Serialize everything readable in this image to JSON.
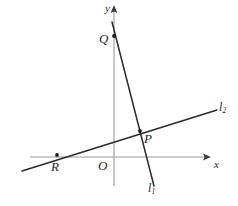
{
  "figure": {
    "background_color": "#ffffff",
    "axis_color": "#9a9a9a",
    "line_color": "#2a2a2a",
    "label_color": "#1e1e1e",
    "width": 238,
    "height": 206
  },
  "axes": {
    "x_axis": {
      "label": "x",
      "start": [
        30,
        157
      ],
      "end": [
        211,
        157
      ],
      "arrow": "right"
    },
    "y_axis": {
      "label": "y",
      "start": [
        114,
        186
      ],
      "end": [
        114,
        5
      ],
      "arrow": "up"
    },
    "origin": {
      "label": "O",
      "position": [
        114,
        157
      ]
    }
  },
  "lines": [
    {
      "id": "l1",
      "label": "l",
      "subscript": "1",
      "description": "steep line with negative slope through Q and P",
      "start": [
        112,
        22
      ],
      "end": [
        154,
        186
      ],
      "slope_sign": "negative"
    },
    {
      "id": "l2",
      "label": "l",
      "subscript": "2",
      "description": "shallow line with positive slope through R and P",
      "start": [
        22,
        171
      ],
      "end": [
        217,
        110
      ],
      "slope_sign": "positive"
    }
  ],
  "points": [
    {
      "label": "Q",
      "description": "y-intercept of line l1",
      "position": [
        114,
        36
      ],
      "label_position": [
        99,
        32
      ]
    },
    {
      "label": "P",
      "description": "intersection of l1 and l2",
      "position": [
        140,
        131
      ],
      "label_position": [
        144,
        132
      ]
    },
    {
      "label": "R",
      "description": "x-intercept of line l2",
      "position": [
        57,
        155
      ],
      "label_position": [
        51,
        160
      ]
    }
  ]
}
